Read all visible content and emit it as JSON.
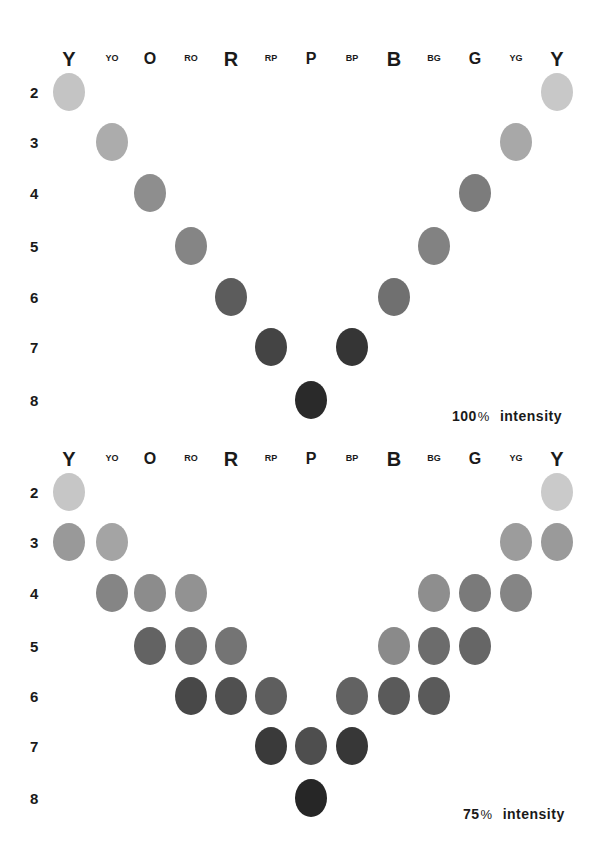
{
  "chart_data": [
    {
      "type": "scatter",
      "title": "100% intensity",
      "columns": [
        "Y",
        "YO",
        "O",
        "RO",
        "R",
        "RP",
        "P",
        "BP",
        "B",
        "BG",
        "G",
        "YG",
        "Y"
      ],
      "rows": [
        2,
        3,
        4,
        5,
        6,
        7,
        8
      ],
      "points": [
        {
          "row": 2,
          "col": "Y",
          "col_index": 0,
          "gray": "#c4c4c4"
        },
        {
          "row": 2,
          "col": "Y",
          "col_index": 12,
          "gray": "#c8c8c8"
        },
        {
          "row": 3,
          "col": "YO",
          "col_index": 1,
          "gray": "#acacac"
        },
        {
          "row": 3,
          "col": "YG",
          "col_index": 11,
          "gray": "#a8a8a8"
        },
        {
          "row": 4,
          "col": "O",
          "col_index": 2,
          "gray": "#8e8e8e"
        },
        {
          "row": 4,
          "col": "G",
          "col_index": 10,
          "gray": "#7c7c7c"
        },
        {
          "row": 5,
          "col": "RO",
          "col_index": 3,
          "gray": "#858585"
        },
        {
          "row": 5,
          "col": "BG",
          "col_index": 9,
          "gray": "#828282"
        },
        {
          "row": 6,
          "col": "R",
          "col_index": 4,
          "gray": "#5c5c5c"
        },
        {
          "row": 6,
          "col": "B",
          "col_index": 8,
          "gray": "#707070"
        },
        {
          "row": 7,
          "col": "RP",
          "col_index": 5,
          "gray": "#444444"
        },
        {
          "row": 7,
          "col": "BP",
          "col_index": 7,
          "gray": "#353535"
        },
        {
          "row": 8,
          "col": "P",
          "col_index": 6,
          "gray": "#2a2a2a"
        }
      ],
      "legend_text": {
        "value": "100",
        "unit": "%",
        "word": "intensity"
      }
    },
    {
      "type": "scatter",
      "title": "75% intensity",
      "columns": [
        "Y",
        "YO",
        "O",
        "RO",
        "R",
        "RP",
        "P",
        "BP",
        "B",
        "BG",
        "G",
        "YG",
        "Y"
      ],
      "rows": [
        2,
        3,
        4,
        5,
        6,
        7,
        8
      ],
      "points": [
        {
          "row": 2,
          "col": "Y",
          "col_index": 0,
          "gray": "#c6c6c6"
        },
        {
          "row": 2,
          "col": "Y",
          "col_index": 12,
          "gray": "#cacaca"
        },
        {
          "row": 3,
          "col": "Y",
          "col_index": 0,
          "gray": "#999999"
        },
        {
          "row": 3,
          "col": "YO",
          "col_index": 1,
          "gray": "#a4a4a4"
        },
        {
          "row": 3,
          "col": "YG",
          "col_index": 11,
          "gray": "#9c9c9c"
        },
        {
          "row": 3,
          "col": "Y",
          "col_index": 12,
          "gray": "#9a9a9a"
        },
        {
          "row": 4,
          "col": "YO",
          "col_index": 1,
          "gray": "#858585"
        },
        {
          "row": 4,
          "col": "O",
          "col_index": 2,
          "gray": "#8c8c8c"
        },
        {
          "row": 4,
          "col": "RO",
          "col_index": 3,
          "gray": "#929292"
        },
        {
          "row": 4,
          "col": "BG",
          "col_index": 9,
          "gray": "#8e8e8e"
        },
        {
          "row": 4,
          "col": "G",
          "col_index": 10,
          "gray": "#7a7a7a"
        },
        {
          "row": 4,
          "col": "YG",
          "col_index": 11,
          "gray": "#858585"
        },
        {
          "row": 5,
          "col": "O",
          "col_index": 2,
          "gray": "#636363"
        },
        {
          "row": 5,
          "col": "RO",
          "col_index": 3,
          "gray": "#6e6e6e"
        },
        {
          "row": 5,
          "col": "R",
          "col_index": 4,
          "gray": "#747474"
        },
        {
          "row": 5,
          "col": "B",
          "col_index": 8,
          "gray": "#8a8a8a"
        },
        {
          "row": 5,
          "col": "BG",
          "col_index": 9,
          "gray": "#6c6c6c"
        },
        {
          "row": 5,
          "col": "G",
          "col_index": 10,
          "gray": "#666666"
        },
        {
          "row": 6,
          "col": "RO",
          "col_index": 3,
          "gray": "#484848"
        },
        {
          "row": 6,
          "col": "R",
          "col_index": 4,
          "gray": "#505050"
        },
        {
          "row": 6,
          "col": "RP",
          "col_index": 5,
          "gray": "#5e5e5e"
        },
        {
          "row": 6,
          "col": "BP",
          "col_index": 7,
          "gray": "#626262"
        },
        {
          "row": 6,
          "col": "B",
          "col_index": 8,
          "gray": "#5a5a5a"
        },
        {
          "row": 6,
          "col": "BG",
          "col_index": 9,
          "gray": "#5a5a5a"
        },
        {
          "row": 7,
          "col": "RP",
          "col_index": 5,
          "gray": "#3a3a3a"
        },
        {
          "row": 7,
          "col": "P",
          "col_index": 6,
          "gray": "#4e4e4e"
        },
        {
          "row": 7,
          "col": "BP",
          "col_index": 7,
          "gray": "#373737"
        },
        {
          "row": 8,
          "col": "P",
          "col_index": 6,
          "gray": "#262626"
        }
      ],
      "legend_text": {
        "value": "75",
        "unit": "%",
        "word": "intensity"
      }
    }
  ],
  "column_labels": [
    {
      "text": "Y",
      "size": "major"
    },
    {
      "text": "YO",
      "size": "minor"
    },
    {
      "text": "O",
      "size": "mid"
    },
    {
      "text": "RO",
      "size": "minor"
    },
    {
      "text": "R",
      "size": "major"
    },
    {
      "text": "RP",
      "size": "minor"
    },
    {
      "text": "P",
      "size": "mid"
    },
    {
      "text": "BP",
      "size": "minor"
    },
    {
      "text": "B",
      "size": "major"
    },
    {
      "text": "BG",
      "size": "minor"
    },
    {
      "text": "G",
      "size": "mid"
    },
    {
      "text": "YG",
      "size": "minor"
    },
    {
      "text": "Y",
      "size": "major"
    }
  ],
  "row_labels": [
    "2",
    "3",
    "4",
    "5",
    "6",
    "7",
    "8"
  ]
}
